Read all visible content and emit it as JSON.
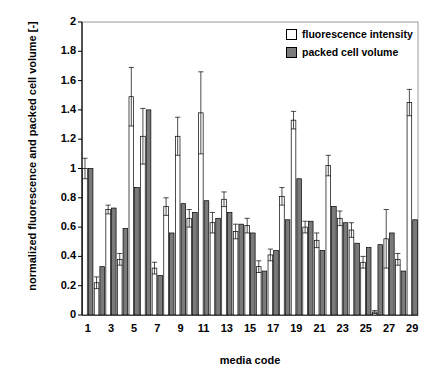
{
  "chart_data": {
    "type": "bar",
    "title": "",
    "xlabel": "media code",
    "ylabel": "normalized fluorescence and packed cell volume [-]",
    "ylim": [
      0,
      2
    ],
    "ytick_step": 0.2,
    "yticks": [
      "0",
      "0.2",
      "0.4",
      "0.6",
      "0.8",
      "1",
      "1.2",
      "1.4",
      "1.6",
      "1.8",
      "2"
    ],
    "grid": false,
    "legend_position": "top-right",
    "categories": [
      1,
      2,
      3,
      4,
      5,
      6,
      7,
      8,
      9,
      10,
      11,
      12,
      13,
      14,
      15,
      16,
      17,
      18,
      19,
      20,
      21,
      22,
      23,
      24,
      25,
      26,
      27,
      28,
      29
    ],
    "xtick_labels": [
      "1",
      "3",
      "5",
      "7",
      "9",
      "11",
      "13",
      "15",
      "17",
      "19",
      "21",
      "23",
      "25",
      "27",
      "29"
    ],
    "series": [
      {
        "name": "fluorescence intensity",
        "color": "#ffffff",
        "edge": "#000000",
        "values": [
          1.0,
          0.22,
          0.72,
          0.38,
          1.49,
          1.22,
          0.32,
          0.74,
          1.22,
          0.66,
          1.38,
          0.63,
          0.79,
          0.57,
          0.61,
          0.33,
          0.41,
          0.81,
          1.33,
          0.6,
          0.51,
          1.02,
          0.66,
          0.58,
          0.36,
          0.02,
          0.52,
          0.38,
          1.45
        ],
        "errors": [
          0.07,
          0.04,
          0.03,
          0.04,
          0.2,
          0.19,
          0.04,
          0.06,
          0.13,
          0.06,
          0.28,
          0.07,
          0.05,
          0.05,
          0.05,
          0.04,
          0.04,
          0.06,
          0.06,
          0.04,
          0.05,
          0.07,
          0.05,
          0.05,
          0.04,
          0.01,
          0.2,
          0.04,
          0.09
        ]
      },
      {
        "name": "packed cell volume",
        "color": "#7a7a7a",
        "edge": "#000000",
        "values": [
          1.0,
          0.33,
          0.73,
          0.59,
          0.87,
          1.4,
          0.27,
          0.56,
          0.76,
          0.7,
          0.78,
          0.66,
          0.7,
          0.62,
          0.56,
          0.3,
          0.44,
          0.65,
          0.93,
          0.64,
          0.44,
          0.74,
          0.63,
          0.49,
          0.46,
          0.48,
          0.56,
          0.3,
          0.65
        ]
      }
    ]
  }
}
